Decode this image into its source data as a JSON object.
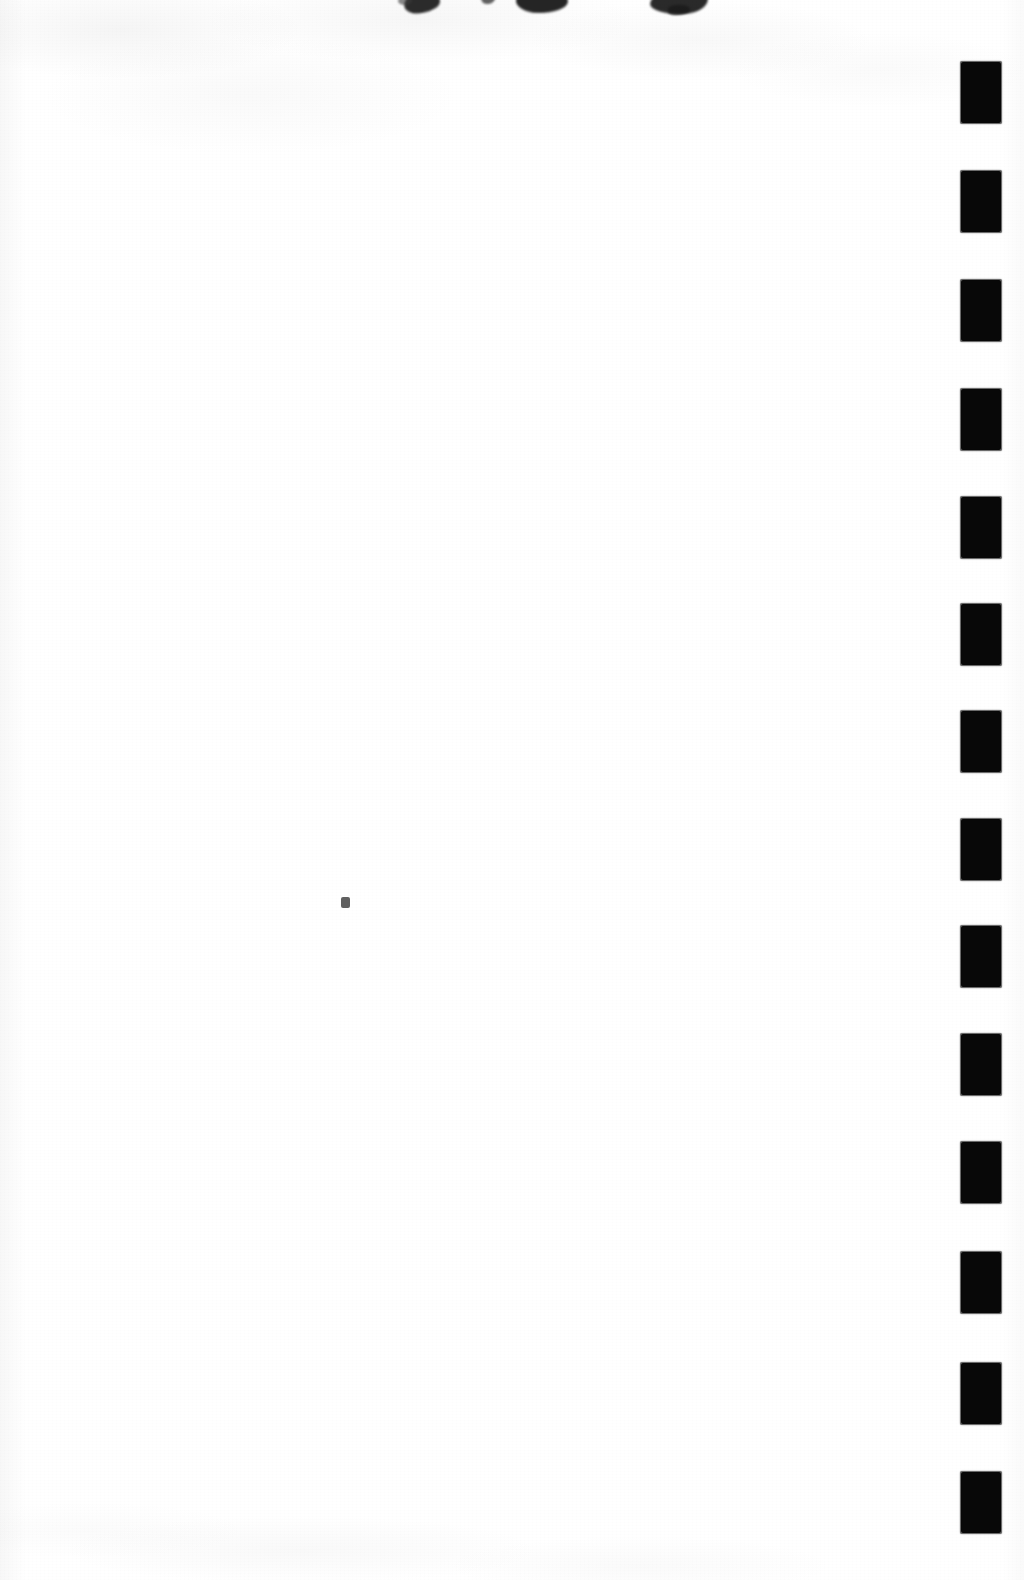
{
  "page": {
    "kind": "scanned-blank-page",
    "width": 1024,
    "height": 1580,
    "background_color": "#ffffff",
    "ink_color": "#080808",
    "visible_text": "",
    "body_text": "",
    "note_label": ""
  },
  "registration_marks": {
    "label": "",
    "count": 14,
    "color": "#080808",
    "edge": "right",
    "mark_width": 40,
    "mark_height": 61,
    "pitch": 108,
    "left_x": 961,
    "items": [
      {
        "index": 1,
        "top": 62
      },
      {
        "index": 2,
        "top": 171
      },
      {
        "index": 3,
        "top": 280
      },
      {
        "index": 4,
        "top": 389
      },
      {
        "index": 5,
        "top": 497
      },
      {
        "index": 6,
        "top": 604
      },
      {
        "index": 7,
        "top": 711
      },
      {
        "index": 8,
        "top": 819
      },
      {
        "index": 9,
        "top": 926
      },
      {
        "index": 10,
        "top": 1034
      },
      {
        "index": 11,
        "top": 1142
      },
      {
        "index": 12,
        "top": 1252
      },
      {
        "index": 13,
        "top": 1363
      },
      {
        "index": 14,
        "top": 1472
      }
    ]
  },
  "top_edge_artifacts": {
    "label": "",
    "color": "#1a1a1a",
    "count": 6,
    "description": ""
  },
  "page_speck": {
    "label": "",
    "color": "#4b4b4b",
    "x": 345,
    "y": 903
  }
}
